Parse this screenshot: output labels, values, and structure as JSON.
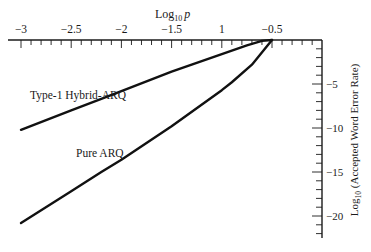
{
  "chart_data": {
    "type": "line",
    "title": "",
    "xlabel": "Log10 p",
    "xlabel_main": "Log",
    "xlabel_sub": "10",
    "xlabel_var": "p",
    "ylabel": "Log10 (Accepted Word Error Rate)",
    "ylabel_main_pre": "Log",
    "ylabel_sub": "10",
    "ylabel_main_post": " (Accepted Word Error Rate)",
    "x_axis_position": "top",
    "y_axis_position": "right",
    "xlim": [
      -3.1,
      -0.0
    ],
    "ylim": [
      -22.5,
      0
    ],
    "grid": false,
    "x_ticks": [
      -3,
      -2.5,
      -2,
      -1.5,
      -1,
      -0.5
    ],
    "x_tick_labels": [
      "−3",
      "−2.5",
      "−2",
      "−1.5",
      "1",
      "−0.5"
    ],
    "y_ticks": [
      -5,
      -10,
      -15,
      -20
    ],
    "y_tick_labels": [
      "−5",
      "−10",
      "−15",
      "−20"
    ],
    "series": [
      {
        "name": "Type-1 Hybrid-ARQ",
        "x": [
          -3.0,
          -2.5,
          -2.2,
          -2.0,
          -1.5,
          -1.3,
          -1.0,
          -0.75,
          -0.6,
          -0.5
        ],
        "y": [
          -10.2,
          -8.0,
          -6.7,
          -5.8,
          -3.6,
          -2.8,
          -1.6,
          -0.6,
          -0.1,
          0.0
        ]
      },
      {
        "name": "Pure ARQ",
        "x": [
          -3.0,
          -2.5,
          -2.2,
          -2.0,
          -1.5,
          -1.0,
          -0.9,
          -0.7,
          -0.5
        ],
        "y": [
          -20.8,
          -17.2,
          -15.0,
          -13.6,
          -9.8,
          -5.7,
          -4.8,
          -2.8,
          0.0
        ]
      }
    ],
    "annotations": [
      {
        "text": "Type-1 Hybrid-ARQ",
        "x": -2.7,
        "y": -6.3
      },
      {
        "text": "Pure ARQ",
        "x": -2.3,
        "y": -12.8
      }
    ]
  }
}
